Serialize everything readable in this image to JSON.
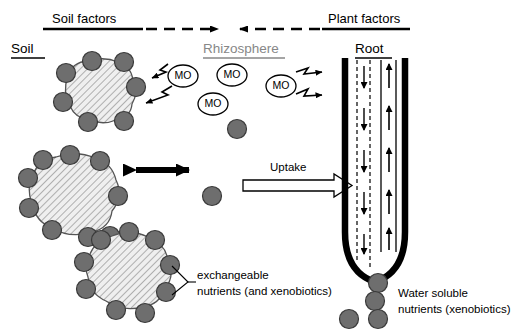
{
  "figure": {
    "width": 512,
    "height": 336,
    "background": "#ffffff"
  },
  "colors": {
    "particle_fill": "#6e6e6e",
    "particle_stroke": "#3a3a3a",
    "aggregate_fill": "#efefef",
    "aggregate_hatch": "#8c8c8c",
    "aggregate_stroke": "#555555",
    "root_wall": "#000000",
    "rhizosphere_text": "#878787",
    "line": "#000000"
  },
  "top_axis": {
    "soil_factors_label": "Soil factors",
    "plant_factors_label": "Plant factors",
    "soil_arrow_style": "solid-then-dashed-right",
    "plant_arrow_style": "solid-then-dashed-left"
  },
  "zones": {
    "soil": {
      "label": "Soil",
      "underline": true
    },
    "rhizosphere": {
      "label": "Rhizosphere",
      "underline": true
    },
    "root": {
      "label": "Root",
      "underline": true
    }
  },
  "microorganisms": {
    "icon": "mo-ellipse",
    "items": [
      {
        "label": "MO",
        "cx": 183,
        "cy": 76
      },
      {
        "label": "MO",
        "cx": 232,
        "cy": 75
      },
      {
        "label": "MO",
        "cx": 213,
        "cy": 104
      },
      {
        "label": "MO",
        "cx": 281,
        "cy": 86
      }
    ]
  },
  "aggregates": [
    {
      "name": "soil-aggregate-top",
      "cx": 96,
      "cy": 93
    },
    {
      "name": "soil-aggregate-middle",
      "cx": 77,
      "cy": 190
    },
    {
      "name": "soil-aggregate-bottom",
      "cx": 132,
      "cy": 262
    }
  ],
  "exchange_arrow": {
    "name": "bidirectional-exchange-arrow",
    "style": "double-headed",
    "x1": 127,
    "x2": 196,
    "y": 170
  },
  "uptake": {
    "label": "Uptake",
    "arrow_style": "hollow-block-arrow-right",
    "x1": 243,
    "x2": 352,
    "y": 185
  },
  "zigzag_arrows": {
    "toward_soil": [
      {
        "from_x": 178,
        "from_y": 66,
        "to_x": 143,
        "to_y": 74
      },
      {
        "from_x": 178,
        "from_y": 88,
        "to_x": 140,
        "to_y": 98
      }
    ],
    "toward_root": [
      {
        "from_x": 292,
        "from_y": 73,
        "to_x": 330,
        "to_y": 78
      },
      {
        "from_x": 292,
        "from_y": 93,
        "to_x": 330,
        "to_y": 97
      }
    ]
  },
  "root": {
    "downward_flow_arrows": 2,
    "upward_flow_arrows": 2,
    "down_arrow_style": "dashed-line-with-down-arrowheads",
    "up_arrow_style": "solid-line-with-up-arrowheads",
    "tip_shape": "rounded-u"
  },
  "free_particles": [
    {
      "cx": 237,
      "cy": 129
    },
    {
      "cx": 212,
      "cy": 196
    }
  ],
  "annotations": {
    "exchangeable": {
      "line1": "exchangeable",
      "line2": "nutrients (and xenobiotics)",
      "leader": "bracket-from-two-particles"
    },
    "water_soluble": {
      "line1": "Water soluble",
      "line2": "nutrients (xenobiotics)",
      "swatch_particles": 4
    }
  },
  "legend_particles": [
    {
      "cx": 378,
      "cy": 283
    },
    {
      "cx": 375,
      "cy": 301
    },
    {
      "cx": 349,
      "cy": 319
    },
    {
      "cx": 378,
      "cy": 319
    }
  ]
}
